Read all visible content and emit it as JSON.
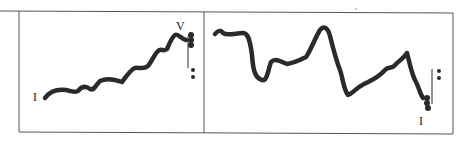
{
  "figure": {
    "type": "pitch-contour diagram",
    "panels": [
      {
        "id": "left",
        "start_label": "I",
        "end_label": "V",
        "description": "rising wavy contour from I to V, ending in cadence marks"
      },
      {
        "id": "right",
        "start_label": "",
        "end_label": "I",
        "description": "fluctuating contour with two peaks, descending to I with cadence marks"
      }
    ],
    "colors": {
      "ink": "#2a2a2a",
      "frame": "#555555",
      "background": "#ffffff"
    }
  }
}
